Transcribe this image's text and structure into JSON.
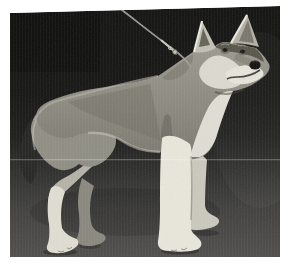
{
  "window": {
    "width": 286,
    "height": 275
  },
  "photo": {
    "alt": "Black-and-white photograph of a wolfdog standing in show stance on a thin lead, body in left profile with head turned toward the viewer, large erect pointed ears, pale muzzle, cheeks, chest and legs, against a dark backdrop on a gray floor",
    "subject": "wolfdog standing on leash",
    "monochrome": true
  },
  "colors": {
    "frame": "#ffffff",
    "backdrop": "#141412",
    "floor": "#4e4d4b",
    "coat-gray": "#8b897f",
    "coat-light": "#e8e6dc",
    "leash": "#a19f95"
  }
}
